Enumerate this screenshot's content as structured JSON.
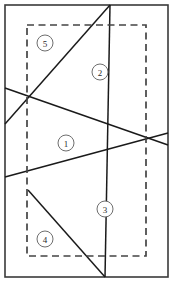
{
  "diagram": {
    "type": "geometric-partition",
    "canvas": {
      "width": 174,
      "height": 283,
      "background": "#ffffff"
    },
    "outer_border": {
      "name": "outer-frame",
      "x": 5,
      "y": 5,
      "width": 163,
      "height": 272,
      "stroke": "#3a3a3a",
      "style": "solid"
    },
    "dashed_region": {
      "name": "inner-dashed-boundary",
      "x": 27,
      "y": 25,
      "width": 119,
      "height": 231,
      "stroke": "#444444",
      "style": "dashed"
    },
    "cut_lines": [
      {
        "id": "line-a",
        "label": "steep-diagonal",
        "x1": 110,
        "y1": 5,
        "x2": 105,
        "y2": 277
      },
      {
        "id": "line-b",
        "label": "upper-left-ray",
        "x1": 5,
        "y1": 124,
        "x2": 110,
        "y2": 5
      },
      {
        "id": "line-c",
        "label": "upper-right-sweep",
        "x1": 5,
        "y1": 88,
        "x2": 168,
        "y2": 145
      },
      {
        "id": "line-d",
        "label": "lower-right-sweep",
        "x1": 5,
        "y1": 177,
        "x2": 168,
        "y2": 133
      },
      {
        "id": "line-e",
        "label": "lower-diagonal",
        "x1": 28,
        "y1": 190,
        "x2": 105,
        "y2": 277
      }
    ],
    "intersections": [
      {
        "id": "node-1",
        "x": 28,
        "y": 97
      },
      {
        "id": "node-2",
        "x": 28,
        "y": 190
      }
    ],
    "region_labels": [
      {
        "id": "region-1",
        "text": "1",
        "cx": 66,
        "cy": 143,
        "r": 8
      },
      {
        "id": "region-2",
        "text": "2",
        "cx": 100,
        "cy": 72,
        "r": 8
      },
      {
        "id": "region-3",
        "text": "3",
        "cx": 105,
        "cy": 209,
        "r": 8
      },
      {
        "id": "region-4",
        "text": "4",
        "cx": 45,
        "cy": 239,
        "r": 8
      },
      {
        "id": "region-5",
        "text": "5",
        "cx": 45,
        "cy": 43,
        "r": 8
      }
    ]
  }
}
